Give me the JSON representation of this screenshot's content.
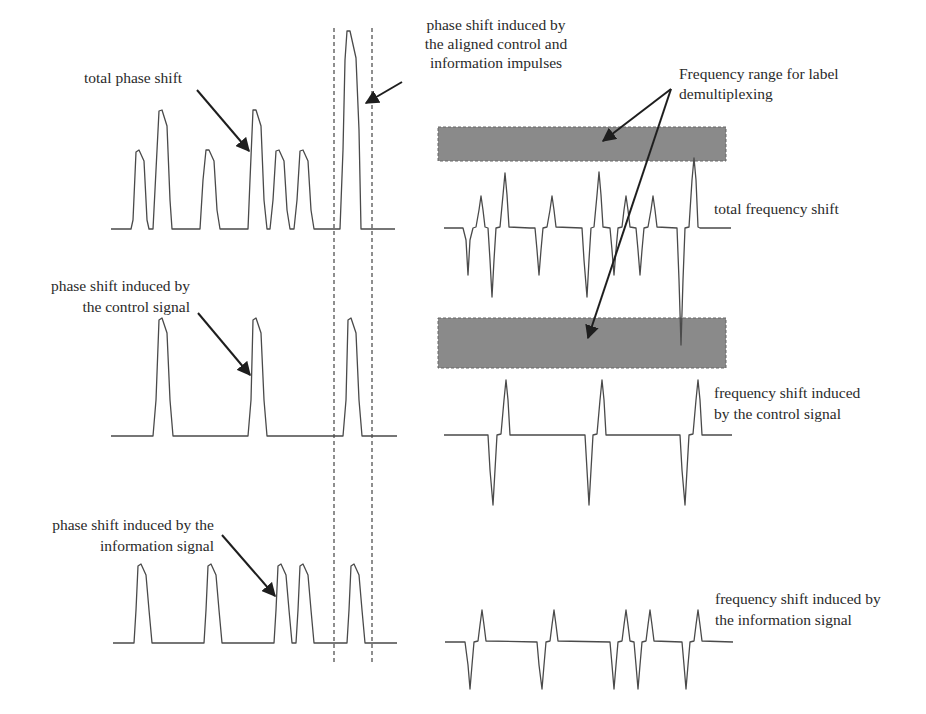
{
  "labels": {
    "total_phase": "total phase shift",
    "aligned_l1": "phase shift induced by",
    "aligned_l2": "the aligned control and",
    "aligned_l3": "information impulses",
    "freq_range_l1": "Frequency range for label",
    "freq_range_l2": "demultiplexing",
    "total_freq": "total frequency shift",
    "ctrl_phase_l1": "phase shift induced by",
    "ctrl_phase_l2": "the control signal",
    "ctrl_freq_l1": "frequency shift induced",
    "ctrl_freq_l2": "by the control signal",
    "info_phase_l1": "phase shift induced by the",
    "info_phase_l2": "information signal",
    "info_freq_l1": "frequency shift induced by",
    "info_freq_l2": "the information signal"
  },
  "colors": {
    "band": "#8a8a8a",
    "wave": "#4a4a4a",
    "arrow": "#1e1e1e"
  },
  "panels": {
    "left": {
      "title": "Phase shift",
      "rows": [
        {
          "name": "total phase shift",
          "baseline_y": 229,
          "pulses_x": [
            141,
            164,
            210,
            257,
            281,
            306,
            349
          ],
          "pulse_heights": [
            "low",
            "high",
            "low",
            "high",
            "low",
            "low",
            "very-high"
          ]
        },
        {
          "name": "phase shift induced by the control signal",
          "baseline_y": 436,
          "pulses_x": [
            164,
            257,
            353
          ],
          "pulse_heights": [
            "high",
            "high",
            "high"
          ]
        },
        {
          "name": "phase shift induced by the information signal",
          "baseline_y": 643,
          "pulses_x": [
            141,
            210,
            281,
            306,
            353
          ],
          "pulse_heights": [
            "low",
            "low",
            "low",
            "low",
            "low"
          ]
        }
      ],
      "alignment_window_x": [
        334,
        371
      ]
    },
    "right": {
      "title": "Frequency shift",
      "rows": [
        {
          "name": "total frequency shift",
          "baseline_y": 228
        },
        {
          "name": "frequency shift induced by the control signal",
          "baseline_y": 435
        },
        {
          "name": "frequency shift induced by the information signal",
          "baseline_y": 642
        }
      ],
      "bands": [
        {
          "name": "upper demultiplexing band",
          "y": [
            127,
            161
          ]
        },
        {
          "name": "lower demultiplexing band",
          "y": [
            318,
            368
          ]
        }
      ]
    }
  }
}
